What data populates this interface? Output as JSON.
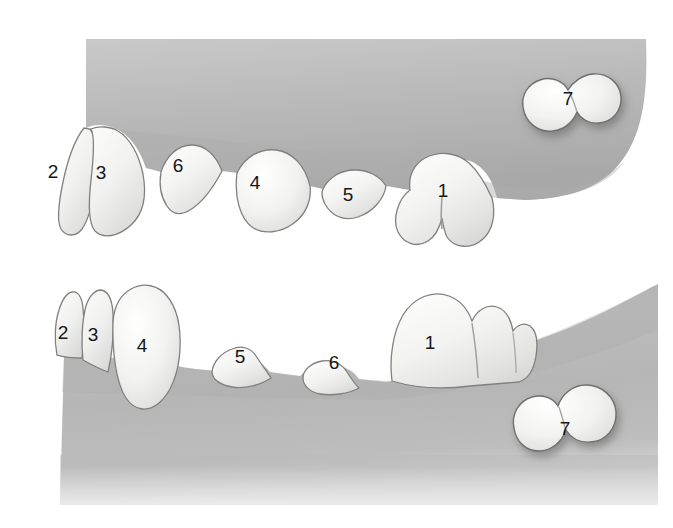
{
  "figure": {
    "background_color": "#ffffff",
    "gum_color": "#b5b5b5",
    "gum_color_dark": "#9d9d9d",
    "gum_color_light": "#c6c6c6",
    "tooth_color": "#f4f4f2",
    "tooth_shadow_color": "#cfcfcf",
    "outline_color": "#6f6f6f",
    "label_color": "#15161a"
  },
  "panels": [
    {
      "name": "upper-jaw",
      "label": "Upper jaw quadrant",
      "teeth": [
        {
          "id": "upper-tooth-2",
          "number": "2",
          "label_x": 53,
          "label_y": 173,
          "erupted": true
        },
        {
          "id": "upper-tooth-3",
          "number": "3",
          "label_x": 101,
          "label_y": 174,
          "erupted": true
        },
        {
          "id": "upper-tooth-6",
          "number": "6",
          "label_x": 178,
          "label_y": 167,
          "erupted": true
        },
        {
          "id": "upper-tooth-4",
          "number": "4",
          "label_x": 255,
          "label_y": 184,
          "erupted": true
        },
        {
          "id": "upper-tooth-5",
          "number": "5",
          "label_x": 348,
          "label_y": 196,
          "erupted": true
        },
        {
          "id": "upper-tooth-1",
          "number": "1",
          "label_x": 443,
          "label_y": 192,
          "erupted": true
        },
        {
          "id": "upper-tooth-7",
          "number": "7",
          "label_x": 568,
          "label_y": 100,
          "erupted": false
        }
      ]
    },
    {
      "name": "lower-jaw",
      "label": "Lower jaw quadrant",
      "teeth": [
        {
          "id": "lower-tooth-2",
          "number": "2",
          "label_x": 63,
          "label_y": 334,
          "erupted": true
        },
        {
          "id": "lower-tooth-3",
          "number": "3",
          "label_x": 93,
          "label_y": 336,
          "erupted": true
        },
        {
          "id": "lower-tooth-4",
          "number": "4",
          "label_x": 142,
          "label_y": 347,
          "erupted": true
        },
        {
          "id": "lower-tooth-5",
          "number": "5",
          "label_x": 240,
          "label_y": 358,
          "erupted": true
        },
        {
          "id": "lower-tooth-6",
          "number": "6",
          "label_x": 334,
          "label_y": 364,
          "erupted": true
        },
        {
          "id": "lower-tooth-1",
          "number": "1",
          "label_x": 430,
          "label_y": 344,
          "erupted": true
        },
        {
          "id": "lower-tooth-7",
          "number": "7",
          "label_x": 565,
          "label_y": 430,
          "erupted": false
        }
      ]
    }
  ]
}
